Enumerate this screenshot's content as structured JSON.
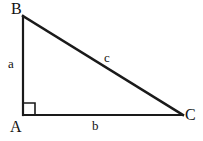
{
  "diagram": {
    "type": "right-triangle",
    "background_color": "#ffffff",
    "stroke_color": "#1a1a1a",
    "vertices": [
      {
        "name": "B",
        "label": "B",
        "x": 23,
        "y": 16
      },
      {
        "name": "A",
        "label": "A",
        "x": 23,
        "y": 115
      },
      {
        "name": "C",
        "label": "C",
        "x": 183,
        "y": 115
      }
    ],
    "sides": [
      {
        "name": "a",
        "label": "a",
        "from": "A",
        "to": "B",
        "orientation": "vertical",
        "stroke_width": 2.2
      },
      {
        "name": "b",
        "label": "b",
        "from": "A",
        "to": "C",
        "orientation": "horizontal",
        "stroke_width": 1.8
      },
      {
        "name": "c",
        "label": "c",
        "from": "B",
        "to": "C",
        "orientation": "hypotenuse",
        "stroke_width": 2.4
      }
    ],
    "right_angle": {
      "at_vertex": "A",
      "marker": "square",
      "x": 23,
      "y": 103,
      "size": 12,
      "stroke_width": 1.6
    }
  }
}
